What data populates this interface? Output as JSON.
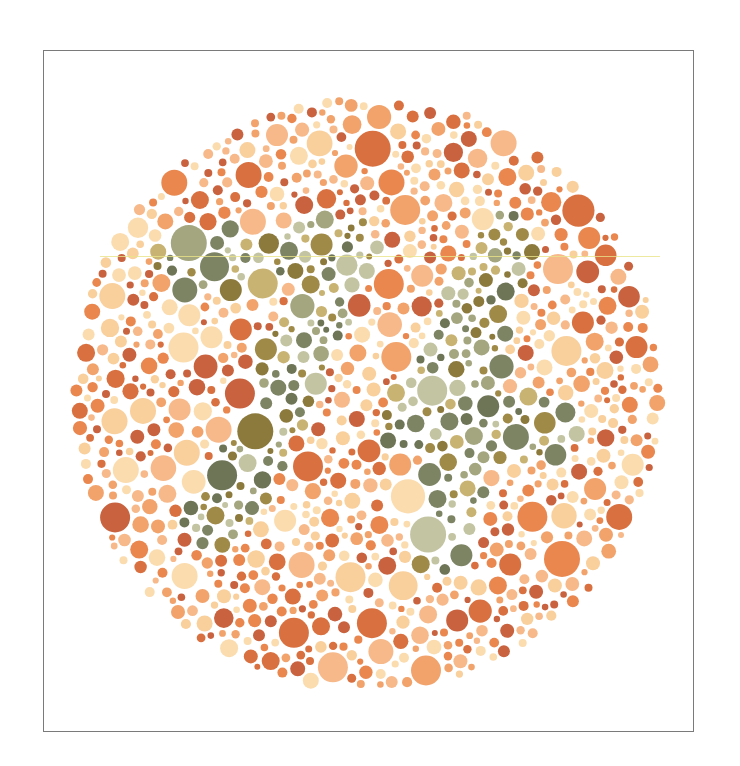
{
  "plate": {
    "title": "Ishihara color vision test plate",
    "hidden_number": "74",
    "center": [
      366,
      394
    ],
    "radius": 300,
    "frame": {
      "x": 43,
      "y": 50,
      "width": 651,
      "height": 682,
      "border_color": "#7a7a7a"
    },
    "background_palette": [
      "#e9874f",
      "#f2a36b",
      "#f7b98a",
      "#f9cf9c",
      "#fbdcae",
      "#d9703f",
      "#c9623e"
    ],
    "figure_palette": [
      "#6e7556",
      "#7d8464",
      "#a3a67e",
      "#c3c4a2",
      "#8c7a3c",
      "#a08a48",
      "#c9b373"
    ],
    "seed": 74
  }
}
